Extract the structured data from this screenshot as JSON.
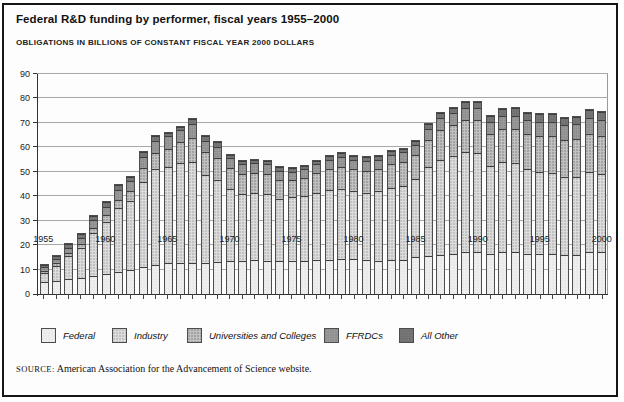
{
  "figure": {
    "title": "Federal R&D funding by performer, fiscal years 1955–2000",
    "subtitle": "OBLIGATIONS IN BILLIONS OF CONSTANT FISCAL YEAR 2000 DOLLARS",
    "source_label": "SOURCE:",
    "source_text": "American Association for the Advancement of Science website."
  },
  "chart_data": {
    "type": "bar",
    "stacked": true,
    "title": "Federal R&D funding by performer, fiscal years 1955–2000",
    "subtitle": "OBLIGATIONS IN BILLIONS OF CONSTANT FISCAL YEAR 2000 DOLLARS",
    "xlabel": "Fiscal year",
    "ylabel": "Obligations in billions of constant fiscal year 2000 dollars",
    "ylim": [
      0,
      90
    ],
    "yticks": [
      0,
      10,
      20,
      30,
      40,
      50,
      60,
      70,
      80,
      90
    ],
    "grid": true,
    "legend_position": "bottom",
    "categories": [
      1955,
      1956,
      1957,
      1958,
      1959,
      1960,
      1961,
      1962,
      1963,
      1964,
      1965,
      1966,
      1967,
      1968,
      1969,
      1970,
      1971,
      1972,
      1973,
      1974,
      1975,
      1976,
      1977,
      1978,
      1979,
      1980,
      1981,
      1982,
      1983,
      1984,
      1985,
      1986,
      1987,
      1988,
      1989,
      1990,
      1991,
      1992,
      1993,
      1994,
      1995,
      1996,
      1997,
      1998,
      1999,
      2000
    ],
    "xtick_labeled_years": [
      1955,
      1960,
      1965,
      1970,
      1975,
      1980,
      1985,
      1990,
      1995,
      2000
    ],
    "series": [
      {
        "name": "Federal",
        "color": "#efefef",
        "values": [
          5.0,
          5.5,
          6.0,
          6.5,
          7.5,
          8.0,
          9.0,
          10.0,
          11.0,
          12.0,
          12.5,
          12.5,
          12.5,
          12.5,
          13.0,
          13.5,
          13.5,
          14.0,
          13.5,
          13.5,
          13.5,
          13.5,
          14.0,
          14.0,
          14.5,
          14.5,
          14.0,
          13.5,
          14.0,
          14.0,
          15.0,
          15.5,
          16.0,
          16.5,
          17.0,
          17.0,
          16.5,
          17.0,
          17.0,
          16.5,
          16.5,
          16.5,
          16.0,
          16.0,
          17.0,
          17.0
        ]
      },
      {
        "name": "Industry",
        "color": "#dcdcdc",
        "values": [
          3.7,
          6.0,
          9.5,
          12.5,
          17.5,
          21.5,
          26.0,
          28.0,
          35.0,
          39.0,
          39.5,
          41.0,
          41.5,
          36.0,
          33.5,
          29.5,
          27.5,
          27.5,
          27.5,
          25.5,
          26.0,
          26.5,
          27.5,
          28.5,
          28.5,
          27.5,
          27.5,
          28.5,
          29.5,
          30.0,
          32.0,
          36.5,
          39.0,
          40.0,
          41.0,
          40.5,
          36.0,
          37.0,
          36.5,
          34.5,
          33.5,
          33.0,
          32.0,
          32.0,
          33.0,
          32.0
        ]
      },
      {
        "name": "Universities and Colleges",
        "color": "#c2c2c2",
        "values": [
          0.8,
          1.0,
          1.3,
          1.6,
          2.2,
          2.8,
          3.6,
          4.3,
          5.5,
          6.5,
          7.5,
          8.5,
          10.0,
          9.5,
          9.0,
          8.5,
          8.0,
          8.0,
          8.0,
          7.5,
          7.0,
          7.5,
          8.0,
          8.5,
          9.0,
          9.0,
          9.0,
          9.0,
          9.5,
          10.0,
          10.0,
          11.0,
          12.0,
          12.5,
          13.0,
          13.5,
          13.0,
          13.5,
          14.0,
          14.5,
          14.5,
          15.0,
          15.0,
          15.5,
          15.5,
          15.5
        ]
      },
      {
        "name": "FFRDCs",
        "color": "#9c9c9c",
        "values": [
          1.5,
          1.8,
          2.2,
          2.4,
          3.0,
          3.2,
          3.9,
          4.0,
          4.5,
          5.0,
          5.0,
          5.0,
          5.5,
          4.8,
          4.7,
          4.0,
          4.0,
          4.0,
          4.0,
          4.0,
          3.5,
          3.5,
          3.5,
          4.0,
          4.0,
          4.0,
          4.0,
          4.0,
          4.0,
          4.0,
          4.0,
          4.5,
          5.0,
          5.0,
          5.0,
          5.0,
          5.0,
          5.3,
          5.5,
          5.5,
          6.0,
          6.0,
          6.0,
          6.0,
          6.5,
          6.5
        ]
      },
      {
        "name": "All Other",
        "color": "#6f6f6f",
        "values": [
          1.0,
          1.2,
          1.5,
          1.5,
          1.8,
          2.0,
          2.0,
          1.7,
          2.0,
          2.0,
          1.5,
          1.5,
          2.0,
          1.7,
          1.8,
          1.5,
          1.5,
          1.5,
          1.5,
          1.5,
          1.5,
          1.5,
          1.5,
          1.5,
          1.5,
          1.5,
          1.5,
          1.5,
          1.5,
          1.5,
          1.5,
          2.0,
          2.0,
          2.0,
          2.5,
          2.5,
          2.5,
          2.7,
          3.0,
          3.0,
          3.0,
          3.0,
          3.0,
          3.0,
          3.5,
          3.5
        ]
      }
    ]
  }
}
